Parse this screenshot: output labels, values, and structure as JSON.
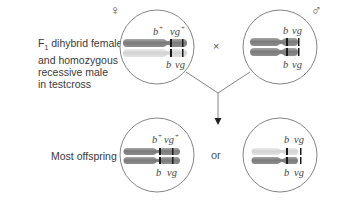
{
  "title_label": {
    "line1_prefix": "F",
    "line1_sub": "1",
    "line1_rest": " dihybrid female",
    "line2": "and homozygous",
    "line3": "recessive male",
    "line4": "in testcross"
  },
  "offspring_label": "Most offspring",
  "cross_symbol": "×",
  "or_label": "or",
  "female_symbol": "♀",
  "male_symbol": "♂",
  "colors": {
    "dark_chromosome": "#8a8a8a",
    "light_chromosome": "#dcdcdc",
    "band": "#1a1a1a",
    "circle_stroke": "#666666",
    "line": "#666666"
  },
  "circles": [
    {
      "id": "female-parent",
      "top": {
        "b": "b",
        "b_sup": "+",
        "vg": "vg",
        "vg_sup": "+"
      },
      "bottom": {
        "b": "b",
        "vg": "vg"
      },
      "top_chrom": "dark",
      "bottom_chrom": "light"
    },
    {
      "id": "male-parent",
      "top": {
        "b": "b",
        "vg": "vg"
      },
      "bottom": {
        "b": "b",
        "vg": "vg"
      },
      "top_chrom": "dark",
      "bottom_chrom": "dark"
    },
    {
      "id": "offspring-wildtype",
      "top": {
        "b": "b",
        "b_sup": "+",
        "vg": "vg",
        "vg_sup": "+"
      },
      "bottom": {
        "b": "b",
        "vg": "vg"
      },
      "top_chrom": "dark",
      "bottom_chrom": "dark"
    },
    {
      "id": "offspring-recessive",
      "top": {
        "b": "b",
        "vg": "vg"
      },
      "bottom": {
        "b": "b",
        "vg": "vg"
      },
      "top_chrom": "light",
      "bottom_chrom": "dark"
    }
  ]
}
